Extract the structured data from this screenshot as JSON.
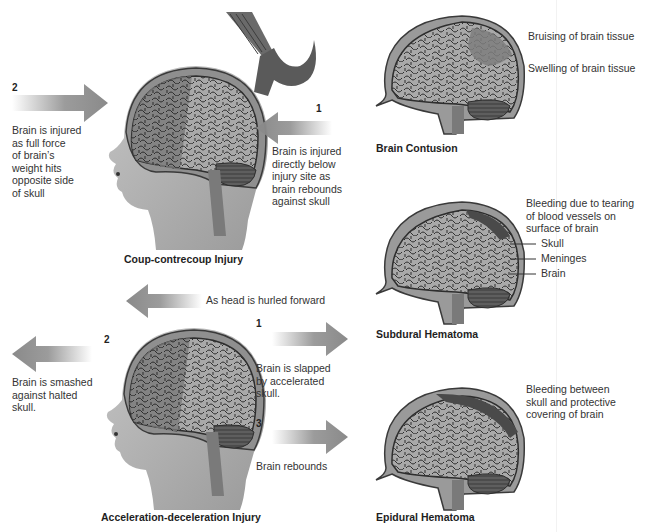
{
  "figure": {
    "colors": {
      "skull": "#9a9a9a",
      "skull_outline": "#3a3a3a",
      "brain": "#a8a8a8",
      "brain_dark": "#707070",
      "gyri_lines": "#2e2e2e",
      "cerebellum": "#5e5e5e",
      "brainstem": "#7a7a7a",
      "face": "#b9b9b9",
      "arrow": "#8a8a8a",
      "hammer": "#5a5a5a",
      "hematoma": "#4a4a4a",
      "bruise": "#7e7e7e"
    },
    "panels": {
      "coup_contrecoup": {
        "title": "Coup-contrecoup Injury",
        "step2_number": "2",
        "step2_text": "Brain is injured\nas full force\nof brain’s\nweight hits\nopposite side\nof skull",
        "step1_number": "1",
        "step1_text": "Brain is injured\ndirectly below\ninjury site as\nbrain rebounds\nagainst skull",
        "icons": [
          "hammer-icon",
          "arrow-right-icon",
          "arrow-left-icon",
          "head-profile-icon"
        ]
      },
      "acceleration_deceleration": {
        "title": "Acceleration-deceleration Injury",
        "top_arrow_text": "As head is hurled forward",
        "step1_number": "1",
        "step1_text": "Brain is slapped\nby accelerated\nskull.",
        "step2_number": "2",
        "step2_text": "Brain is smashed\nagainst halted\nskull.",
        "step3_number": "3",
        "step3_text": "Brain rebounds"
      },
      "brain_contusion": {
        "title": "Brain Contusion",
        "notes": [
          "Bruising of brain tissue",
          "Swelling of brain tissue"
        ]
      },
      "subdural_hematoma": {
        "title": "Subdural Hematoma",
        "description": "Bleeding due to tearing\nof blood vessels on\nsurface of brain",
        "labels": [
          "Skull",
          "Meninges",
          "Brain"
        ]
      },
      "epidural_hematoma": {
        "title": "Epidural Hematoma",
        "description": "Bleeding between\nskull and protective\ncovering of brain"
      }
    }
  }
}
